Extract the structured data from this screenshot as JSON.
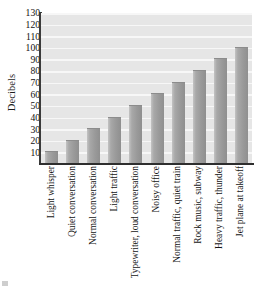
{
  "chart_data": {
    "type": "bar",
    "title": "",
    "xlabel": "",
    "ylabel": "Decibels",
    "categories": [
      "Light whisper",
      "Quiet conversation",
      "Normal conversation",
      "Light traffic",
      "Typewriter, loud conversation",
      "Noisy office",
      "Normal traffic, quiet train",
      "Rock music, subway",
      "Heavy traffic, thunder",
      "Jet plane at takeoff"
    ],
    "values": [
      10,
      20,
      30,
      40,
      50,
      60,
      70,
      80,
      90,
      100
    ],
    "ylim": [
      0,
      130
    ],
    "ytick_values": [
      10,
      20,
      30,
      40,
      50,
      60,
      70,
      80,
      90,
      100,
      110,
      120,
      130
    ],
    "ytick_labels": [
      "10",
      "20",
      "30",
      "40",
      "50",
      "60",
      "70",
      "80",
      "90",
      "100",
      "110",
      "120",
      "130"
    ],
    "grid": "horizontal",
    "legend": "none",
    "colors": {
      "bar_fill": "#9a9a9a",
      "bar_fill_light": "#c3c3c3",
      "plot_background": "#e6e6e6",
      "gridline": "#f7f7f7",
      "axis": "#2e2e2e",
      "text": "#141414",
      "page_background": "#ffffff"
    }
  }
}
